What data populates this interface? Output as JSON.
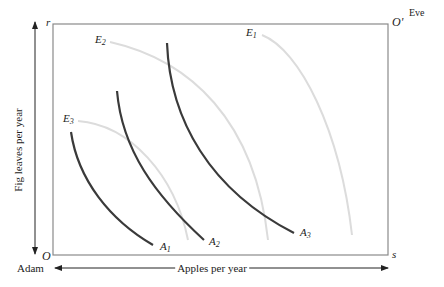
{
  "diagram": {
    "type": "edgeworth-box",
    "origins": {
      "adam": {
        "symbol": "O",
        "name": "Adam"
      },
      "eve": {
        "symbol": "O'",
        "name": "Eve"
      }
    },
    "corners": {
      "top_left": "r",
      "bottom_right": "s"
    },
    "axes": {
      "vertical": "Fig leaves per year",
      "horizontal": "Apples per year"
    },
    "adam_indifference_curves": [
      {
        "label": "A",
        "sub": "1"
      },
      {
        "label": "A",
        "sub": "2"
      },
      {
        "label": "A",
        "sub": "3"
      }
    ],
    "eve_indifference_curves": [
      {
        "label": "E",
        "sub": "1"
      },
      {
        "label": "E",
        "sub": "2"
      },
      {
        "label": "E",
        "sub": "3"
      }
    ],
    "colors": {
      "frame": "#8a8a8a",
      "adam_curves": "#3a3a3a",
      "eve_curves": "#d8d8d8",
      "arrows": "#222222"
    }
  }
}
